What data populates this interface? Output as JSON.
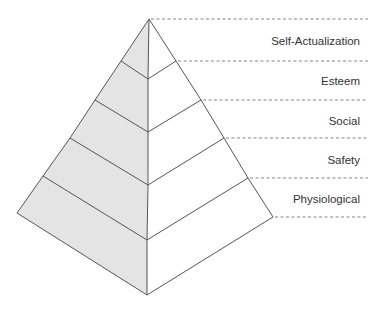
{
  "diagram": {
    "type": "pyramid",
    "colors": {
      "left_face": "#e4e4e4",
      "right_face": "#ffffff",
      "edge": "#555555",
      "dash": "#666666",
      "text": "#333333"
    },
    "apex": [
      149,
      19
    ],
    "center_points": [
      [
        148,
        79
      ],
      [
        148,
        132
      ],
      [
        148,
        185
      ],
      [
        147,
        240
      ],
      [
        147,
        295
      ]
    ],
    "left_points": [
      [
        121,
        61
      ],
      [
        95,
        100
      ],
      [
        70,
        138
      ],
      [
        43,
        176
      ],
      [
        17,
        213
      ]
    ],
    "right_points": [
      [
        176,
        61
      ],
      [
        201,
        100
      ],
      [
        224,
        138
      ],
      [
        248,
        178
      ],
      [
        273,
        217
      ]
    ],
    "dash_lines": [
      {
        "x1": 149,
        "y": 19
      },
      {
        "x1": 176,
        "y": 61
      },
      {
        "x1": 201,
        "y": 100
      },
      {
        "x1": 224,
        "y": 138
      },
      {
        "x1": 248,
        "y": 178
      },
      {
        "x1": 273,
        "y": 217
      }
    ],
    "dash_end_x": 368,
    "levels": [
      {
        "label": "Self-Actualization",
        "y": 45
      },
      {
        "label": "Esteem",
        "y": 85
      },
      {
        "label": "Social",
        "y": 125
      },
      {
        "label": "Safety",
        "y": 164
      },
      {
        "label": "Physiological",
        "y": 203
      }
    ],
    "label_right_x": 360
  }
}
